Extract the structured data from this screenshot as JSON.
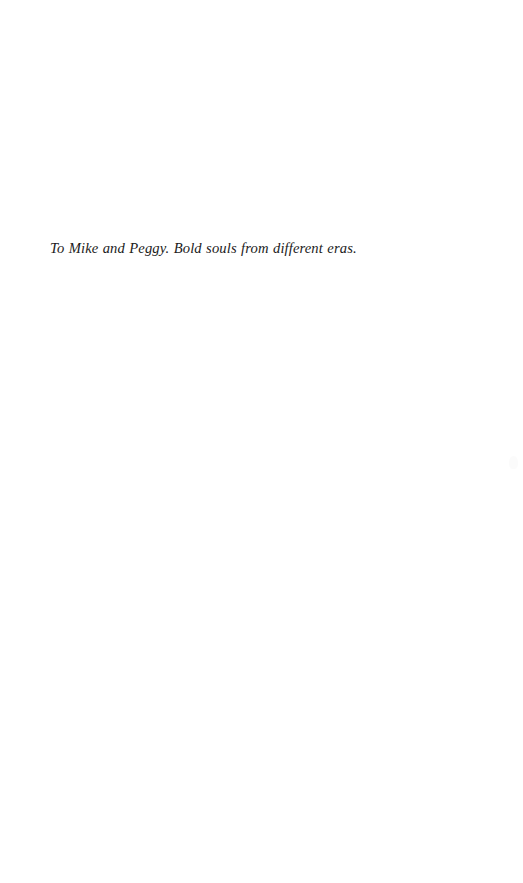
{
  "page": {
    "background_color": "#ffffff",
    "text_color": "#1b1b1b",
    "width": 523,
    "height": 883
  },
  "dedication": {
    "text": "To Mike and Peggy. Bold souls from different eras."
  },
  "artifacts": {
    "scan_smudge": {
      "name": "scan-artifact",
      "color": "#fbfbfb"
    }
  }
}
